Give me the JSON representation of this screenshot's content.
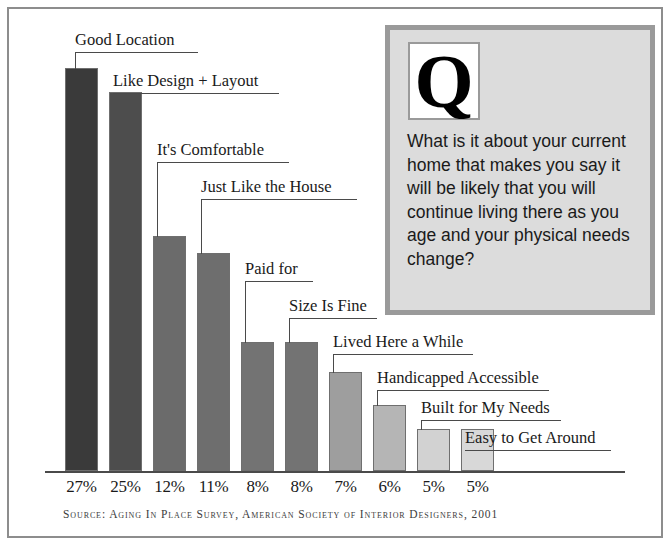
{
  "chart_data": {
    "type": "bar",
    "title": "",
    "subtitle": "",
    "xlabel": "",
    "ylabel": "",
    "ylim": [
      0,
      30
    ],
    "grid": false,
    "legend": "none",
    "categories": [
      "Good Location",
      "Like Design + Layout",
      "It's Comfortable",
      "Just Like the House",
      "Paid for",
      "Size Is Fine",
      "Lived Here a While",
      "Handicapped Accessible",
      "Built for My Needs",
      "Easy to Get Around"
    ],
    "values": [
      27,
      25,
      12,
      11,
      8,
      8,
      7,
      6,
      5,
      5
    ],
    "tick_labels": [
      "27%",
      "25%",
      "12%",
      "11%",
      "8%",
      "8%",
      "7%",
      "6%",
      "5%",
      "5%"
    ],
    "bar_colors": [
      "#3a3a3a",
      "#4d4d4d",
      "#6b6b6b",
      "#6e6e6e",
      "#737373",
      "#737373",
      "#9e9e9e",
      "#b5b5b5",
      "#d2d2d2",
      "#d8d8d8"
    ],
    "annotation": "SOURCE: AGING IN PLACE SURVEY, AMERICAN SOCIETY OF INTERIOR DESIGNERS, 2001"
  },
  "bars": [
    {
      "label": "Good Location",
      "pct": "27%",
      "value": 27,
      "x": 65,
      "w": 33,
      "top": 68,
      "color": "#3a3a3a"
    },
    {
      "label": "Like Design + Layout",
      "pct": "25%",
      "value": 25,
      "x": 109,
      "w": 33,
      "top": 92,
      "color": "#4d4d4d"
    },
    {
      "label": "It's Comfortable",
      "pct": "12%",
      "value": 12,
      "x": 153,
      "w": 33,
      "top": 236,
      "color": "#6b6b6b"
    },
    {
      "label": "Just Like the House",
      "pct": "11%",
      "value": 11,
      "x": 197,
      "w": 33,
      "top": 253,
      "color": "#6e6e6e"
    },
    {
      "label": "Paid for",
      "pct": "8%",
      "value": 8,
      "x": 241,
      "w": 33,
      "top": 342,
      "color": "#737373"
    },
    {
      "label": "Size Is Fine",
      "pct": "8%",
      "value": 8,
      "x": 285,
      "w": 33,
      "top": 342,
      "color": "#737373"
    },
    {
      "label": "Lived Here a While",
      "pct": "7%",
      "value": 7,
      "x": 329,
      "w": 33,
      "top": 372,
      "color": "#9e9e9e"
    },
    {
      "label": "Handicapped Accessible",
      "pct": "6%",
      "value": 6,
      "x": 373,
      "w": 33,
      "top": 405,
      "color": "#b5b5b5"
    },
    {
      "label": "Built for My Needs",
      "pct": "5%",
      "value": 5,
      "x": 417,
      "w": 33,
      "top": 429,
      "color": "#d2d2d2"
    },
    {
      "label": "Easy to Get Around",
      "pct": "5%",
      "value": 5,
      "x": 461,
      "w": 33,
      "top": 429,
      "color": "#d8d8d8"
    }
  ],
  "callouts": [
    {
      "label": "Good Location",
      "text_left": 75,
      "line_bottom": 52,
      "line_width": 123,
      "drop": 16
    },
    {
      "label": "Like Design + Layout",
      "text_left": 113,
      "line_bottom": 93,
      "line_width": 166,
      "drop": 0
    },
    {
      "label": "It's Comfortable",
      "text_left": 157,
      "line_bottom": 162,
      "line_width": 132,
      "drop": 75
    },
    {
      "label": "Just Like the House",
      "text_left": 201,
      "line_bottom": 199,
      "line_width": 156,
      "drop": 55
    },
    {
      "label": "Paid for",
      "text_left": 245,
      "line_bottom": 281,
      "line_width": 68,
      "drop": 62
    },
    {
      "label": "Size Is Fine",
      "text_left": 289,
      "line_bottom": 318,
      "line_width": 88,
      "drop": 25
    },
    {
      "label": "Lived Here a While",
      "text_left": 333,
      "line_bottom": 354,
      "line_width": 140,
      "drop": 19
    },
    {
      "label": "Handicapped Accessible",
      "text_left": 377,
      "line_bottom": 390,
      "line_width": 172,
      "drop": 16
    },
    {
      "label": "Built for My Needs",
      "text_left": 421,
      "line_bottom": 420,
      "line_width": 140,
      "drop": 10
    },
    {
      "label": "Easy to Get Around",
      "text_left": 465,
      "line_bottom": 450,
      "line_width": 146,
      "drop": 0
    }
  ],
  "question_box": {
    "letter": "Q",
    "text": "What is it about your current home that makes you say it will be likely that you will continue living there as you age and your physical needs change?"
  },
  "source": {
    "text": "Source: Aging In Place Survey, American Society of Interior Designers, 2001"
  },
  "colors": {
    "frame": "#8d8d8d",
    "axis": "#4a4a4a",
    "leader": "#4a4a4a",
    "qbox_border": "#9a9a9a",
    "qbox_background": "#dcdcdc",
    "text": "#1a1a1a"
  }
}
